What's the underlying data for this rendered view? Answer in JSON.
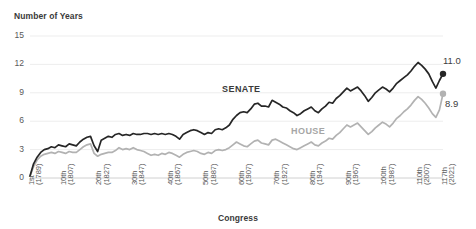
{
  "chart_data": {
    "type": "line",
    "title": "",
    "ylabel": "Number of Years",
    "xlabel": "Congress",
    "ylim": [
      0,
      15
    ],
    "yticks": [
      "0",
      "3",
      "6",
      "9",
      "12",
      "15"
    ],
    "grid": true,
    "legend_position": "inline-annotations",
    "xtick_labels": [
      "1st\n(1789)",
      "10th\n(1807)",
      "20th\n(1827)",
      "30th\n(1847)",
      "40th\n(1867)",
      "50th\n(1887)",
      "60th\n(1907)",
      "70th\n(1927)",
      "80th\n(1947)",
      "90th\n(1967)",
      "100th\n(1987)",
      "110th\n(2007)",
      "117th\n(2021)"
    ],
    "xticks": [
      {
        "ordinal": "1st",
        "year": "(1789)",
        "index": 1
      },
      {
        "ordinal": "10th",
        "year": "(1807)",
        "index": 10
      },
      {
        "ordinal": "20th",
        "year": "(1827)",
        "index": 20
      },
      {
        "ordinal": "30th",
        "year": "(1847)",
        "index": 30
      },
      {
        "ordinal": "40th",
        "year": "(1867)",
        "index": 40
      },
      {
        "ordinal": "50th",
        "year": "(1887)",
        "index": 50
      },
      {
        "ordinal": "60th",
        "year": "(1907)",
        "index": 60
      },
      {
        "ordinal": "70th",
        "year": "(1927)",
        "index": 70
      },
      {
        "ordinal": "80th",
        "year": "(1947)",
        "index": 80
      },
      {
        "ordinal": "90th",
        "year": "(1967)",
        "index": 90
      },
      {
        "ordinal": "100th",
        "year": "(1987)",
        "index": 100
      },
      {
        "ordinal": "110th",
        "year": "(2007)",
        "index": 110
      },
      {
        "ordinal": "117th",
        "year": "(2021)",
        "index": 117
      }
    ],
    "x": [
      1,
      2,
      3,
      4,
      5,
      6,
      7,
      8,
      9,
      10,
      11,
      12,
      13,
      14,
      15,
      16,
      17,
      18,
      19,
      20,
      21,
      22,
      23,
      24,
      25,
      26,
      27,
      28,
      29,
      30,
      31,
      32,
      33,
      34,
      35,
      36,
      37,
      38,
      39,
      40,
      41,
      42,
      43,
      44,
      45,
      46,
      47,
      48,
      49,
      50,
      51,
      52,
      53,
      54,
      55,
      56,
      57,
      58,
      59,
      60,
      61,
      62,
      63,
      64,
      65,
      66,
      67,
      68,
      69,
      70,
      71,
      72,
      73,
      74,
      75,
      76,
      77,
      78,
      79,
      80,
      81,
      82,
      83,
      84,
      85,
      86,
      87,
      88,
      89,
      90,
      91,
      92,
      93,
      94,
      95,
      96,
      97,
      98,
      99,
      100,
      101,
      102,
      103,
      104,
      105,
      106,
      107,
      108,
      109,
      110,
      111,
      112,
      113,
      114,
      115,
      116,
      117
    ],
    "series": [
      {
        "name": "SENATE",
        "color": "#262626",
        "label_value": "11.0",
        "endpoint_marker": true,
        "values": [
          0.2,
          1.5,
          2.2,
          2.7,
          3.0,
          3.1,
          3.3,
          3.2,
          3.5,
          3.4,
          3.3,
          3.6,
          3.5,
          3.4,
          3.8,
          4.1,
          4.3,
          4.4,
          3.4,
          2.8,
          4.0,
          4.2,
          4.4,
          4.3,
          4.6,
          4.7,
          4.5,
          4.6,
          4.5,
          4.7,
          4.6,
          4.6,
          4.7,
          4.7,
          4.6,
          4.7,
          4.6,
          4.7,
          4.6,
          4.7,
          4.6,
          4.4,
          4.1,
          4.6,
          4.8,
          5.0,
          5.1,
          5.0,
          4.8,
          4.6,
          4.8,
          4.7,
          5.1,
          5.2,
          5.1,
          5.3,
          5.6,
          6.2,
          6.6,
          6.9,
          7.0,
          6.9,
          7.3,
          7.8,
          7.9,
          7.6,
          7.6,
          7.5,
          8.2,
          8.0,
          7.8,
          7.5,
          7.4,
          7.1,
          6.9,
          6.6,
          6.8,
          7.1,
          7.3,
          7.5,
          7.1,
          6.9,
          7.3,
          7.6,
          8.0,
          7.9,
          8.4,
          8.7,
          9.1,
          9.5,
          9.2,
          9.4,
          9.6,
          9.2,
          8.7,
          8.1,
          8.5,
          9.0,
          9.3,
          9.6,
          9.4,
          9.1,
          9.5,
          10.0,
          10.3,
          10.6,
          10.9,
          11.3,
          11.8,
          12.2,
          11.9,
          11.5,
          11.0,
          10.2,
          9.5,
          10.3,
          11.0
        ]
      },
      {
        "name": "HOUSE",
        "color": "#b2b2b2",
        "label_value": "8.9",
        "endpoint_marker": true,
        "values": [
          0.2,
          1.2,
          1.9,
          2.3,
          2.5,
          2.6,
          2.7,
          2.6,
          2.8,
          2.7,
          2.6,
          2.8,
          2.7,
          2.7,
          3.0,
          3.3,
          3.5,
          3.6,
          2.6,
          2.3,
          2.5,
          2.6,
          2.7,
          2.7,
          2.9,
          3.2,
          3.0,
          3.1,
          3.0,
          3.2,
          3.0,
          2.9,
          2.8,
          2.6,
          2.4,
          2.5,
          2.4,
          2.6,
          2.5,
          2.7,
          2.6,
          2.4,
          2.2,
          2.5,
          2.7,
          2.8,
          2.9,
          2.8,
          2.6,
          2.5,
          2.7,
          2.6,
          2.9,
          3.0,
          2.9,
          3.0,
          3.2,
          3.5,
          3.8,
          3.6,
          3.4,
          3.3,
          3.6,
          3.9,
          4.0,
          3.7,
          3.6,
          3.5,
          4.0,
          4.1,
          3.9,
          3.7,
          3.5,
          3.3,
          3.1,
          3.0,
          3.2,
          3.4,
          3.6,
          3.8,
          3.5,
          3.4,
          3.7,
          3.9,
          4.2,
          4.1,
          4.5,
          4.8,
          5.2,
          5.6,
          5.4,
          5.6,
          5.8,
          5.4,
          5.0,
          4.6,
          4.9,
          5.3,
          5.6,
          5.9,
          5.7,
          5.4,
          5.8,
          6.3,
          6.6,
          7.0,
          7.3,
          7.7,
          8.2,
          8.6,
          8.3,
          7.9,
          7.4,
          6.8,
          6.4,
          7.2,
          8.9
        ]
      }
    ]
  }
}
